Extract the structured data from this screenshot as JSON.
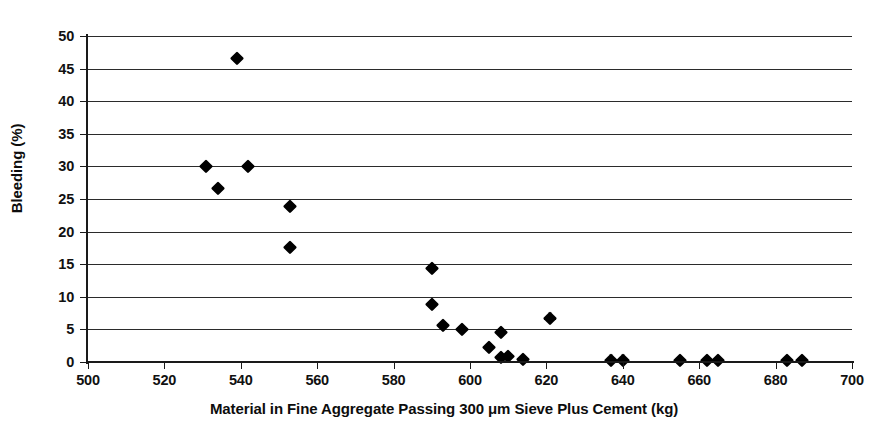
{
  "chart_data": {
    "type": "scatter",
    "title": "",
    "xlabel": "Material in Fine Aggregate Passing 300 μm Sieve Plus Cement (kg)",
    "ylabel": "Bleeding (%)",
    "xlim": [
      500,
      700
    ],
    "ylim": [
      0,
      50
    ],
    "xticks": [
      500,
      520,
      540,
      560,
      580,
      600,
      620,
      640,
      660,
      680,
      700
    ],
    "yticks": [
      0,
      5,
      10,
      15,
      20,
      25,
      30,
      35,
      40,
      45,
      50
    ],
    "xtick_labels": [
      "500",
      "520",
      "540",
      "560",
      "580",
      "600",
      "620",
      "640",
      "660",
      "680",
      "700"
    ],
    "ytick_labels": [
      "0",
      "5",
      "10",
      "15",
      "20",
      "25",
      "30",
      "35",
      "40",
      "45",
      "50"
    ],
    "grid": "horizontal",
    "legend": "none",
    "marker": "diamond",
    "marker_color": "#000000",
    "series": [
      {
        "name": "Bleeding vs material passing 300 um sieve plus cement",
        "points": [
          {
            "x": 539,
            "y": 46.6
          },
          {
            "x": 531,
            "y": 30.0
          },
          {
            "x": 542,
            "y": 30.1
          },
          {
            "x": 534,
            "y": 26.7
          },
          {
            "x": 553,
            "y": 23.9
          },
          {
            "x": 553,
            "y": 17.7
          },
          {
            "x": 590,
            "y": 14.4
          },
          {
            "x": 590,
            "y": 8.9
          },
          {
            "x": 593,
            "y": 5.7
          },
          {
            "x": 598,
            "y": 5.1
          },
          {
            "x": 608,
            "y": 4.6
          },
          {
            "x": 621,
            "y": 6.7
          },
          {
            "x": 605,
            "y": 2.3
          },
          {
            "x": 608,
            "y": 0.7
          },
          {
            "x": 610,
            "y": 0.9
          },
          {
            "x": 614,
            "y": 0.4
          },
          {
            "x": 637,
            "y": 0.3
          },
          {
            "x": 640,
            "y": 0.3
          },
          {
            "x": 655,
            "y": 0.3
          },
          {
            "x": 662,
            "y": 0.3
          },
          {
            "x": 665,
            "y": 0.3
          },
          {
            "x": 683,
            "y": 0.3
          },
          {
            "x": 687,
            "y": 0.3
          }
        ]
      }
    ]
  },
  "figure": {
    "background_color": "#ffffff",
    "axis_color": "#1a1a1a",
    "grid_color": "#2b2b2b"
  }
}
